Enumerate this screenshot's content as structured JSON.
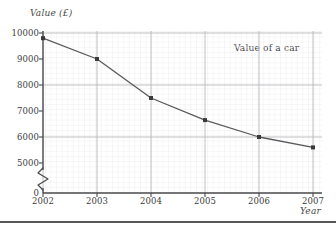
{
  "chart_data": {
    "type": "line",
    "title": "",
    "annotation": "Value of a car",
    "xlabel": "Year",
    "ylabel": "Value (£)",
    "categories": [
      "2002",
      "2003",
      "2004",
      "2005",
      "2006",
      "2007"
    ],
    "x": [
      2002,
      2003,
      2004,
      2005,
      2006,
      2007
    ],
    "values": [
      9800,
      9000,
      7500,
      6650,
      6000,
      5600
    ],
    "series": [
      {
        "name": "Value of a car",
        "values": [
          9800,
          9000,
          7500,
          6650,
          6000,
          5600
        ]
      }
    ],
    "ylim": [
      5000,
      10000
    ],
    "y_axis_break": true,
    "y_axis_break_symbol": "zigzag",
    "ytick_labels": [
      "0",
      "5000",
      "6000",
      "7000",
      "8000",
      "9000",
      "10000"
    ],
    "ytick_values": [
      0,
      5000,
      6000,
      7000,
      8000,
      9000,
      10000
    ],
    "major_gridlines_y": [
      6000,
      8000,
      10000
    ],
    "minor_grid_step_y": 200,
    "xtick_labels": [
      "2002",
      "2003",
      "2004",
      "2005",
      "2006",
      "2007"
    ],
    "grid": true,
    "legend": "none",
    "legend_position": "none",
    "line_color": "#59595b",
    "marker_color": "#3a3a3a",
    "marker_shape": "square",
    "grid_minor_color": "#e3e3e6",
    "grid_major_color": "#b9b9bd",
    "axis_color": "#4a4a4c"
  },
  "axes": {
    "y_title": "Value (£)",
    "x_title": "Year"
  },
  "ticks": {
    "y": [
      {
        "label": "10000",
        "value": 10000
      },
      {
        "label": "9000",
        "value": 9000
      },
      {
        "label": "8000",
        "value": 8000
      },
      {
        "label": "7000",
        "value": 7000
      },
      {
        "label": "6000",
        "value": 6000
      },
      {
        "label": "5000",
        "value": 5000
      },
      {
        "label": "0",
        "value": 0
      }
    ],
    "x": [
      {
        "label": "2002"
      },
      {
        "label": "2003"
      },
      {
        "label": "2004"
      },
      {
        "label": "2005"
      },
      {
        "label": "2006"
      },
      {
        "label": "2007"
      }
    ]
  },
  "annotation": {
    "text": "Value of a car"
  }
}
